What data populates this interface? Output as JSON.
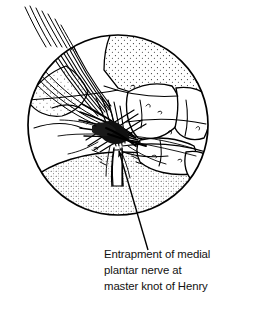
{
  "figure": {
    "kind": "medical-anatomical-line-drawing",
    "view": "circular inset view of plantar foot dissection",
    "caption_lines": [
      "Entrapment of medial",
      "plantar nerve at",
      "master knot of Henry"
    ],
    "caption_full": "Entrapment of medial plantar nerve at master knot of Henry",
    "colors": {
      "ink": "#000000",
      "background": "#ffffff",
      "caption": "#111111"
    },
    "circle_frame": {
      "center_x": 118,
      "center_y": 125,
      "radius": 91,
      "stroke_width": 1.6
    },
    "leader": {
      "from_x": 148,
      "from_y": 250,
      "to_x": 118,
      "to_y": 150,
      "arrowhead": "at tendon knot"
    },
    "labels": {
      "structure_pointed_at": "master knot of Henry",
      "nerve": "medial plantar nerve",
      "condition": "entrapment"
    },
    "regions": [
      {
        "name": "tendon-strands-upper-left",
        "texture": "parallel fiber lines"
      },
      {
        "name": "stippled-bone-upper",
        "texture": "stipple"
      },
      {
        "name": "stippled-bone-left",
        "texture": "stipple"
      },
      {
        "name": "knot-of-henry",
        "texture": "dense crossed hatching"
      },
      {
        "name": "bone-blocks-right",
        "texture": "outline"
      },
      {
        "name": "stippled-pad-lower",
        "texture": "stipple"
      }
    ]
  }
}
